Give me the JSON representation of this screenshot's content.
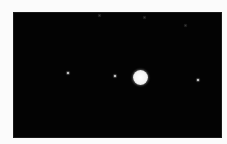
{
  "image": {
    "subject": "Jupiter with moons against a black night sky",
    "background_color": "#030303",
    "border_color": "#fbfbfb",
    "planet": {
      "name": "Jupiter",
      "cx": 140,
      "cy": 77,
      "radius": 7.5,
      "color": "#f4f4f4"
    },
    "moons": [
      {
        "cx": 68,
        "cy": 73
      },
      {
        "cx": 115,
        "cy": 76
      },
      {
        "cx": 198,
        "cy": 80
      }
    ],
    "faint_specks": [
      {
        "cx": 99,
        "cy": 15
      },
      {
        "cx": 144,
        "cy": 17
      },
      {
        "cx": 185,
        "cy": 25
      }
    ]
  }
}
